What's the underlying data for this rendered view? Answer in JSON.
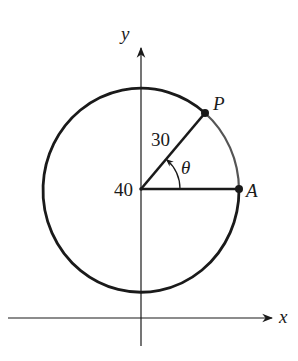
{
  "diagram": {
    "type": "geometry-figure",
    "axes": {
      "x_label": "x",
      "y_label": "y"
    },
    "labels": {
      "center_value": "40",
      "radius_value": "30",
      "angle": "θ",
      "point_p": "P",
      "point_a": "A"
    },
    "colors": {
      "stroke": "#1a1a1a",
      "arc_highlight": "#555555",
      "background": "#ffffff"
    },
    "geometry": {
      "center": [
        141,
        190
      ],
      "radius": 98,
      "point_a": [
        239,
        190
      ],
      "point_p": [
        205,
        113
      ]
    }
  }
}
